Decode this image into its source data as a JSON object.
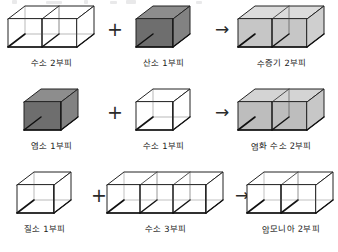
{
  "figure": {
    "title_visible": false,
    "background_color": "#ffffff",
    "ink_color": "#1f1f1f",
    "style": "hand-drawn pencil sketch"
  },
  "palette": {
    "clear": "#ffffff",
    "light_gray": "#c9c9c9",
    "dark_gray": "#767676",
    "stroke": "#222222",
    "shadow_edge": "#111111"
  },
  "operators": {
    "plus": "+",
    "arrow": "→"
  },
  "rows": [
    {
      "id": "reaction-water-vapor",
      "reactant_a": {
        "label": "수소 2부피",
        "volumes": 2,
        "fill": "clear"
      },
      "operator": "+",
      "reactant_b": {
        "label": "산소 1부피",
        "volumes": 1,
        "fill": "dark_gray"
      },
      "yields": "→",
      "product": {
        "label": "수증기 2부피",
        "volumes": 2,
        "fill": "light_gray"
      }
    },
    {
      "id": "reaction-hydrogen-chloride",
      "reactant_a": {
        "label": "염소 1부피",
        "volumes": 1,
        "fill": "dark_gray"
      },
      "operator": "+",
      "reactant_b": {
        "label": "수소 1부피",
        "volumes": 1,
        "fill": "clear"
      },
      "yields": "→",
      "product": {
        "label": "염화 수소 2부피",
        "volumes": 2,
        "fill": "light_gray"
      }
    },
    {
      "id": "reaction-ammonia",
      "reactant_a": {
        "label": "질소 1부피",
        "volumes": 1,
        "fill": "clear"
      },
      "operator": "+",
      "reactant_b": {
        "label": "수소 3부피",
        "volumes": 3,
        "fill": "clear"
      },
      "yields": "→",
      "product": {
        "label": "암모니아 2부피",
        "volumes": 2,
        "fill": "clear"
      }
    }
  ]
}
